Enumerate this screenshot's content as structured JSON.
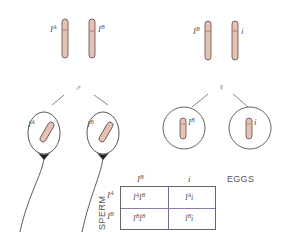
{
  "colors": {
    "chromosome_fill": "#e6c2b4",
    "chromosome_stroke": "#5a4a48",
    "centromere_band": "#b07a62",
    "line": "#666666",
    "grid_line": "#7a6a9a"
  },
  "parents": {
    "male": {
      "symbol": "♂",
      "chromosomes": [
        {
          "allele_base": "I",
          "allele_sup": "A"
        },
        {
          "allele_base": "I",
          "allele_sup": "B"
        }
      ]
    },
    "female": {
      "symbol": "♀",
      "chromosomes": [
        {
          "allele_base": "I",
          "allele_sup": "B"
        },
        {
          "allele_base": "i",
          "allele_sup": ""
        }
      ]
    }
  },
  "gametes": {
    "sperm": [
      {
        "allele_base": "I",
        "allele_sup": "A"
      },
      {
        "allele_base": "I",
        "allele_sup": "B"
      }
    ],
    "eggs": [
      {
        "allele_base": "I",
        "allele_sup": "B"
      },
      {
        "allele_base": "i",
        "allele_sup": ""
      }
    ]
  },
  "punnett": {
    "col_axis_label": "EGGS",
    "row_axis_label": "SPERM",
    "columns": [
      {
        "base": "I",
        "sup": "B"
      },
      {
        "base": "i",
        "sup": ""
      }
    ],
    "rows": [
      {
        "base": "I",
        "sup": "A"
      },
      {
        "base": "I",
        "sup": "B"
      }
    ],
    "cells": [
      [
        {
          "a_base": "I",
          "a_sup": "A",
          "b_base": "I",
          "b_sup": "B"
        },
        {
          "a_base": "I",
          "a_sup": "A",
          "b_base": "i",
          "b_sup": ""
        }
      ],
      [
        {
          "a_base": "I",
          "a_sup": "B",
          "b_base": "I",
          "b_sup": "B"
        },
        {
          "a_base": "I",
          "a_sup": "B",
          "b_base": "i",
          "b_sup": ""
        }
      ]
    ]
  }
}
